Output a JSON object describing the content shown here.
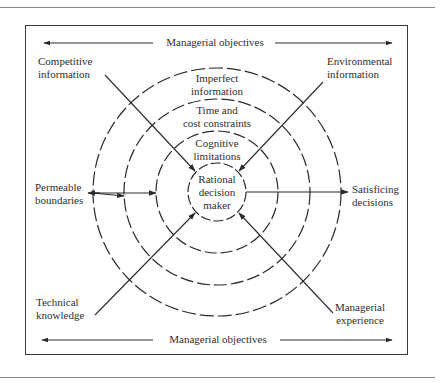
{
  "diagram": {
    "top_objectives": "Managerial objectives",
    "bottom_objectives": "Managerial objectives",
    "inputs": {
      "competitive": [
        "Competitive",
        "information"
      ],
      "environmental": [
        "Environmental",
        "information"
      ],
      "technical": [
        "Technical",
        "knowledge"
      ],
      "experience": [
        "Managerial",
        "experience"
      ],
      "permeable": [
        "Permeable",
        "boundaries"
      ]
    },
    "output": [
      "Satisficing",
      "decisions"
    ],
    "rings": {
      "outer": [
        "Imperfect",
        "information"
      ],
      "second": [
        "Time and",
        "cost constraints"
      ],
      "third": [
        "Cognitive",
        "limitations"
      ],
      "center": [
        "Rational",
        "decision",
        "maker"
      ]
    },
    "geometry": {
      "center": [
        217,
        192
      ],
      "radii": [
        124,
        93,
        61,
        29
      ]
    },
    "colors": {
      "line": "#2a2a2a",
      "rule": "#8a8a8a",
      "background": "#ffffff"
    }
  }
}
